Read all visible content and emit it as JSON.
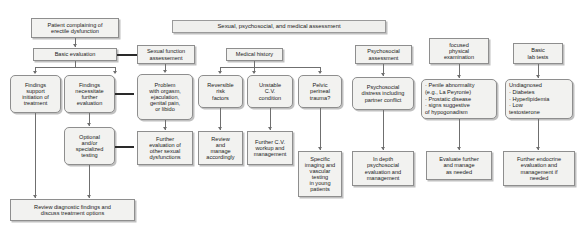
{
  "figure": {
    "type": "flowchart"
  },
  "header": {
    "assessment_band": "Sexual, psychosocial, and medical assessment"
  },
  "entry": {
    "patient": "Patient complaining of\nerectile dysfunction",
    "basic_evaluation": "Basic evaluation"
  },
  "findings": {
    "support": "Findings\nsupport\ninitiation of\ntreatment",
    "necessitate": "Findings\nnecessitate\nfurther\nevaluation",
    "optional_testing": "Optional\nand/or\nspecialized\ntesting",
    "review": "Review diagnostic findings and\ndiscuss treatment options"
  },
  "columns": [
    {
      "heading": "Sexual function\nassessement",
      "finding": "Problem\nwith orgasm,\nejaculation,\ngenital pain,\nor libido",
      "action": "Further\nevaluation of\nother sexual\ndysfunctions"
    },
    {
      "heading": "Medical history",
      "branches": [
        {
          "finding": "Reversible\nrisk\nfactors",
          "action": "Review\nand\nmanage\naccordingly"
        },
        {
          "finding": "Unstable\nC.V.\ncondition",
          "action": "Further C.V.\nworkup and\nmanagement"
        },
        {
          "finding": "Pelvic\nperineal\ntrauma?",
          "action": "Specific\nimaging and\nvascular\ntesting\nin young\npatients"
        }
      ]
    },
    {
      "heading": "Psychosocial\nassessment",
      "finding": "Psychosocial\ndistress including\npartner conflict",
      "action": "In depth\npsychosocial\nevaluation and\nmanagement"
    },
    {
      "heading": "focused\nphysical\nexamination",
      "finding": "· Penile abnormality\n  (e.g., La Peyronie)\n· Prostatic disease\n· signs suggestive\n  of hypogonadism",
      "action": "Evaluate further\nand manage\nas needed"
    },
    {
      "heading": "Basic\nlab tests",
      "finding": "Undiagnosed\n· Diabetes\n· Hyperlipidemia\n· Low\n  testosterone",
      "action": "Further endocrine\nevaluation and\nmanagement if\nneeded"
    }
  ],
  "colors": {
    "node_fill": "#f2f2f0",
    "node_border": "#8e8e8e",
    "connector": "#6f6f6f",
    "emphasis_connector": "#2a2a2a",
    "text": "#1b1b1b",
    "background": "#ffffff"
  }
}
